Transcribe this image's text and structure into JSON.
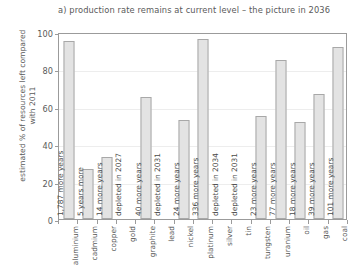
{
  "chart_data": {
    "type": "bar",
    "title": "a) production rate remains at current level – the picture in 2036",
    "xlabel": "",
    "ylabel": "estimated % of resources left compared with 2011",
    "ylim": [
      0,
      100
    ],
    "yticks": [
      0,
      20,
      40,
      60,
      80,
      100
    ],
    "grid": true,
    "legend": "none",
    "categories": [
      "aluminium",
      "cadmium",
      "copper",
      "gold",
      "graphite",
      "lead",
      "nickel",
      "platinum",
      "silver",
      "tin",
      "tungsten",
      "uranium",
      "oil",
      "gas",
      "coal"
    ],
    "values": [
      95,
      27,
      33,
      0,
      65,
      0,
      53,
      96,
      0,
      0,
      55,
      85,
      52,
      67,
      92
    ],
    "annotations": [
      "1,787 more years",
      "5 years more",
      "14 more years",
      "depleted in 2027",
      "40 more years",
      "depleted in 2031",
      "24 more years",
      "336 more years",
      "depleted in 2034",
      "depleted in 2031",
      "23 more years",
      "77 more years",
      "18 more years",
      "39 more years",
      "101 more years"
    ]
  }
}
